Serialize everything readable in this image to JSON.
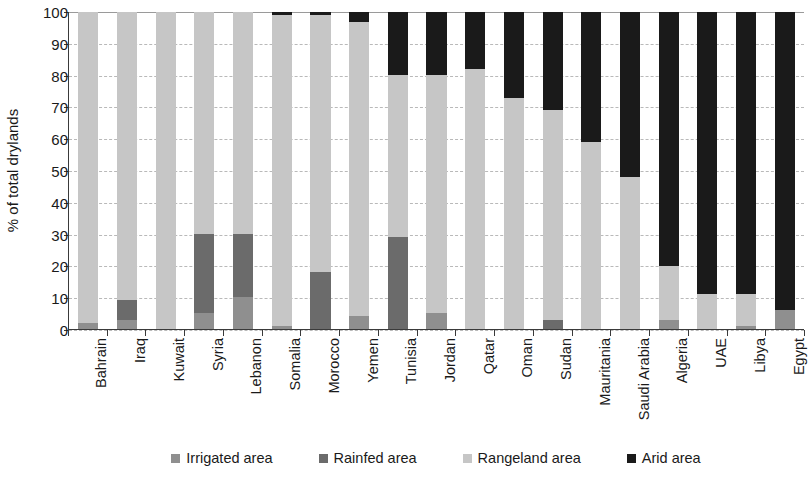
{
  "chart_data": {
    "type": "bar",
    "stacked": true,
    "title": "",
    "subtitle": "",
    "xlabel": "",
    "ylabel": "% of total drylands",
    "ylim": [
      0,
      100
    ],
    "yticks": [
      0,
      10,
      20,
      30,
      40,
      50,
      60,
      70,
      80,
      90,
      100
    ],
    "ytick_labels": [
      "0",
      "10",
      "20",
      "30",
      "40",
      "50",
      "60",
      "70",
      "80",
      "90",
      "100"
    ],
    "grid": true,
    "grid_axis": "y",
    "legend_position": "bottom",
    "categories": [
      "Bahrain",
      "Iraq",
      "Kuwait",
      "Syria",
      "Lebanon",
      "Somalia",
      "Morocco",
      "Yemen",
      "Tunisia",
      "Jordan",
      "Qatar",
      "Oman",
      "Sudan",
      "Mauritania",
      "Saudi Arabia",
      "Algeria",
      "UAE",
      "Libya",
      "Egypt"
    ],
    "series": [
      {
        "name": "Irrigated area",
        "color": "#8f8f8f",
        "values": [
          2,
          3,
          0,
          5,
          10,
          1,
          0,
          4,
          0,
          5,
          0,
          0,
          0,
          0,
          0,
          3,
          0,
          1,
          6
        ]
      },
      {
        "name": "Rainfed area",
        "color": "#6b6b6b",
        "values": [
          0,
          6,
          0,
          25,
          20,
          0,
          18,
          0,
          29,
          0,
          0,
          0,
          3,
          0,
          0,
          0,
          0,
          0,
          0
        ]
      },
      {
        "name": "Rangeland area",
        "color": "#c6c6c6",
        "values": [
          98,
          91,
          100,
          70,
          70,
          98,
          81,
          93,
          51,
          75,
          82,
          73,
          66,
          59,
          48,
          17,
          11,
          10,
          0
        ]
      },
      {
        "name": "Arid area",
        "color": "#1a1a1a",
        "values": [
          0,
          0,
          0,
          0,
          0,
          1,
          1,
          3,
          20,
          20,
          18,
          27,
          31,
          41,
          52,
          80,
          89,
          89,
          94
        ]
      }
    ]
  },
  "legend": {
    "items": [
      {
        "label": "Irrigated area",
        "color": "#8f8f8f"
      },
      {
        "label": "Rainfed area",
        "color": "#6b6b6b"
      },
      {
        "label": "Rangeland area",
        "color": "#c6c6c6"
      },
      {
        "label": "Arid area",
        "color": "#1a1a1a"
      }
    ]
  },
  "axes": {
    "y_title": "% of total drylands"
  }
}
